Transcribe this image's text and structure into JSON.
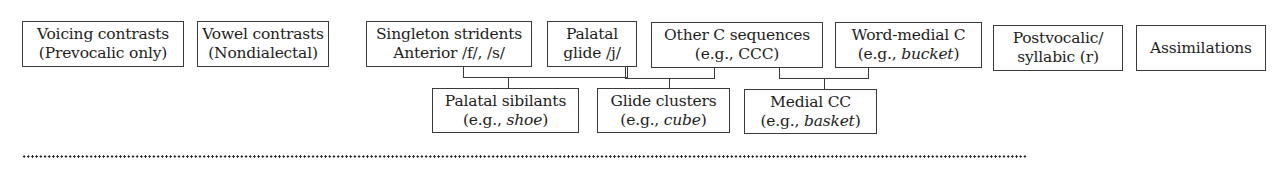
{
  "diagram": {
    "top_row": [
      {
        "id": "voicing",
        "line1": "Voicing contrasts",
        "line2": "(Prevocalic only)"
      },
      {
        "id": "vowel",
        "line1": "Vowel contrasts",
        "line2": "(Nondialectal)"
      },
      {
        "id": "singleton",
        "line1": "Singleton stridents",
        "line2": "Anterior /f/, /s/"
      },
      {
        "id": "palatal-glide",
        "line1": "Palatal",
        "line2": "glide /j/"
      },
      {
        "id": "other-c",
        "line1": "Other C sequences",
        "line2": "(e.g., CCC)"
      },
      {
        "id": "word-medial",
        "line1": "Word-medial C",
        "line2_prefix": "(e.g., ",
        "line2_italic": "bucket",
        "line2_suffix": ")"
      },
      {
        "id": "postvocalic",
        "line1": "Postvocalic/",
        "line2": "syllabic (r)"
      },
      {
        "id": "assimilations",
        "line1": "Assimilations"
      }
    ],
    "bottom_row": [
      {
        "id": "palatal-sibilants",
        "line1": "Palatal sibilants",
        "line2_prefix": "(e.g., ",
        "line2_italic": "shoe",
        "line2_suffix": ")",
        "parents": [
          "singleton",
          "palatal-glide"
        ]
      },
      {
        "id": "glide-clusters",
        "line1": "Glide clusters",
        "line2_prefix": "(e.g., ",
        "line2_italic": "cube",
        "line2_suffix": ")",
        "parents": [
          "palatal-glide",
          "other-c"
        ]
      },
      {
        "id": "medial-cc",
        "line1": "Medial CC",
        "line2_prefix": "(e.g., ",
        "line2_italic": "basket",
        "line2_suffix": ")",
        "parents": [
          "other-c",
          "word-medial"
        ]
      }
    ],
    "separator": "dotted-line"
  }
}
